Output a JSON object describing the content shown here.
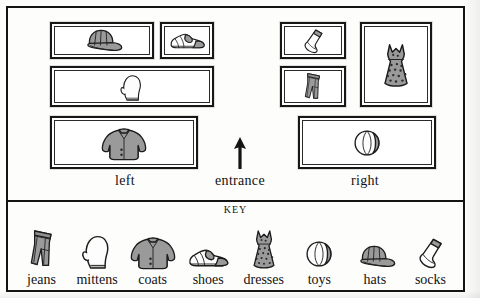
{
  "page": {
    "type": "store-map-worksheet",
    "background_color": "#fdfdfb",
    "ink_color": "#141414"
  },
  "map": {
    "labels": {
      "left": "left",
      "entrance": "entrance",
      "right": "right"
    },
    "arrow_icon": "up-arrow-icon",
    "shelves": [
      {
        "id": "shelf-hats",
        "side": "left",
        "item": "hats",
        "icon": "cap-icon",
        "x": 42,
        "y": 14,
        "w": 104,
        "h": 37
      },
      {
        "id": "shelf-shoes",
        "side": "left",
        "item": "shoes",
        "icon": "shoe-icon",
        "x": 152,
        "y": 14,
        "w": 54,
        "h": 37
      },
      {
        "id": "shelf-mittens",
        "side": "left",
        "item": "mittens",
        "icon": "mitten-icon",
        "x": 42,
        "y": 58,
        "w": 164,
        "h": 41
      },
      {
        "id": "shelf-coats",
        "side": "left",
        "item": "coats",
        "icon": "coat-icon",
        "x": 42,
        "y": 108,
        "w": 148,
        "h": 53
      },
      {
        "id": "shelf-socks",
        "side": "right",
        "item": "socks",
        "icon": "sock-icon",
        "x": 272,
        "y": 14,
        "w": 66,
        "h": 37
      },
      {
        "id": "shelf-jeans",
        "side": "right",
        "item": "jeans",
        "icon": "jeans-icon",
        "x": 272,
        "y": 58,
        "w": 66,
        "h": 41
      },
      {
        "id": "shelf-dresses",
        "side": "right",
        "item": "dresses",
        "icon": "dress-icon",
        "x": 352,
        "y": 14,
        "w": 72,
        "h": 85
      },
      {
        "id": "shelf-toys",
        "side": "right",
        "item": "toys",
        "icon": "ball-icon",
        "x": 290,
        "y": 108,
        "w": 138,
        "h": 53
      }
    ]
  },
  "key": {
    "title": "KEY",
    "items": [
      {
        "label": "jeans",
        "icon": "jeans-icon"
      },
      {
        "label": "mittens",
        "icon": "mitten-icon"
      },
      {
        "label": "coats",
        "icon": "coat-icon"
      },
      {
        "label": "shoes",
        "icon": "shoe-icon"
      },
      {
        "label": "dresses",
        "icon": "dress-icon"
      },
      {
        "label": "toys",
        "icon": "ball-icon"
      },
      {
        "label": "hats",
        "icon": "cap-icon"
      },
      {
        "label": "socks",
        "icon": "sock-icon"
      }
    ]
  }
}
